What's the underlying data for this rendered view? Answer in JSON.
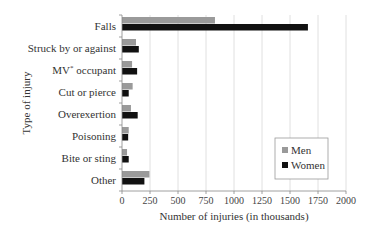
{
  "chart_data": {
    "type": "bar",
    "orientation": "horizontal",
    "title": "",
    "xlabel": "Number of injuries (in thousands)",
    "ylabel": "Type of injury",
    "xlim": [
      0,
      2000
    ],
    "xticks": [
      0,
      250,
      500,
      750,
      1000,
      1250,
      1500,
      1750,
      2000
    ],
    "grid": "vertical",
    "legend_position": "lower right",
    "categories": [
      "Falls",
      "Struck by or against",
      "MV* occupant",
      "Cut or pierce",
      "Overexertion",
      "Poisoning",
      "Bite or sting",
      "Other"
    ],
    "series": [
      {
        "name": "Men",
        "color": "#9a9a9a",
        "values": [
          830,
          125,
          90,
          95,
          80,
          60,
          45,
          245
        ]
      },
      {
        "name": "Women",
        "color": "#111111",
        "values": [
          1660,
          150,
          135,
          60,
          140,
          55,
          60,
          200
        ]
      }
    ]
  }
}
